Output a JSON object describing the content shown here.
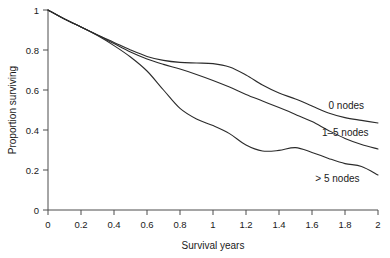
{
  "chart_data": {
    "type": "line",
    "title": "",
    "xlabel": "Survival years",
    "ylabel": "Proportion surviving",
    "xlim": [
      0,
      2
    ],
    "ylim": [
      0,
      1
    ],
    "grid": false,
    "legend_position": "inline-right-of-curves",
    "xticks": [
      "0",
      "0.2",
      "0.4",
      "0.6",
      "0.8",
      "1",
      "1.2",
      "1.4",
      "1.6",
      "1.8",
      "2"
    ],
    "xtick_values": [
      0,
      0.2,
      0.4,
      0.6,
      0.8,
      1,
      1.2,
      1.4,
      1.6,
      1.8,
      2
    ],
    "yticks": [
      "0",
      "0.2",
      "0.4",
      "0.6",
      "0.8",
      "1"
    ],
    "ytick_values": [
      0,
      0.2,
      0.4,
      0.6,
      0.8,
      1
    ],
    "x": [
      0,
      0.1,
      0.2,
      0.3,
      0.4,
      0.5,
      0.6,
      0.7,
      0.8,
      0.9,
      1.0,
      1.1,
      1.2,
      1.3,
      1.4,
      1.5,
      1.6,
      1.7,
      1.8,
      1.9,
      2.0
    ],
    "series": [
      {
        "name": "0 nodes",
        "label": "0 nodes",
        "values": [
          1.0,
          0.955,
          0.915,
          0.875,
          0.838,
          0.8,
          0.768,
          0.748,
          0.738,
          0.735,
          0.732,
          0.715,
          0.675,
          0.625,
          0.585,
          0.555,
          0.52,
          0.485,
          0.462,
          0.448,
          0.435
        ]
      },
      {
        "name": "1-5 nodes",
        "label": "1–5 nodes",
        "values": [
          1.0,
          0.955,
          0.915,
          0.875,
          0.832,
          0.79,
          0.755,
          0.728,
          0.705,
          0.678,
          0.648,
          0.615,
          0.578,
          0.545,
          0.512,
          0.478,
          0.442,
          0.398,
          0.358,
          0.328,
          0.305
        ]
      },
      {
        "name": "> 5 nodes",
        "label": "> 5 nodes",
        "values": [
          1.0,
          0.955,
          0.915,
          0.872,
          0.822,
          0.765,
          0.695,
          0.6,
          0.508,
          0.455,
          0.422,
          0.382,
          0.325,
          0.295,
          0.298,
          0.312,
          0.288,
          0.258,
          0.232,
          0.218,
          0.175
        ]
      }
    ],
    "annotations": [
      {
        "text": "0 nodes",
        "x": 1.7,
        "y": 0.525
      },
      {
        "text": "1–5 nodes",
        "x": 1.66,
        "y": 0.388
      },
      {
        "text": "> 5 nodes",
        "x": 1.62,
        "y": 0.156
      }
    ]
  },
  "colors": {
    "curve": "#2b2b2b",
    "axis": "#4d4d4d",
    "text": "#1a1a1a",
    "background": "#ffffff"
  }
}
